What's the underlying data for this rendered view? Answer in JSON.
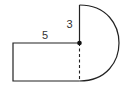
{
  "diagram": {
    "labels": {
      "rect_width": "5",
      "radius": "3"
    },
    "colors": {
      "stroke": "#222222",
      "text": "#333333",
      "background": "#ffffff"
    },
    "shapes": {
      "rectangle": {
        "x": 13,
        "y": 43,
        "width": 66.5,
        "height": 38
      },
      "semicircle": {
        "center_x": 79.5,
        "center_y": 43,
        "top_y": 5,
        "bottom_y": 81,
        "right_x": 119
      },
      "dashed_segment": {
        "x": 79.5,
        "y1": 43,
        "y2": 81
      },
      "center_point": {
        "x": 79.5,
        "y": 43
      }
    }
  }
}
